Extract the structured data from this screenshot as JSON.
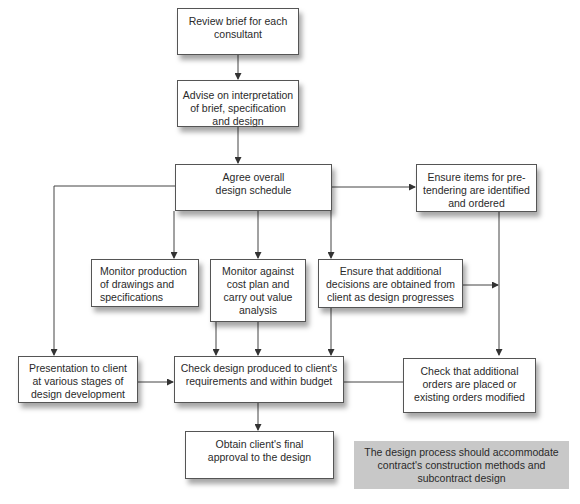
{
  "diagram": {
    "nodes": [
      {
        "id": "review_brief",
        "label": "Review brief for each consultant"
      },
      {
        "id": "advise",
        "label": "Advise on interpretation of brief, specification and design"
      },
      {
        "id": "agree_schedule",
        "label": "Agree overall design schedule"
      },
      {
        "id": "pretendering",
        "label": "Ensure items for pre-tendering are identified and ordered"
      },
      {
        "id": "monitor_drawings",
        "label": "Monitor production of drawings and specifications"
      },
      {
        "id": "monitor_cost",
        "label": "Monitor against cost plan and carry out value analysis"
      },
      {
        "id": "additional_decisions",
        "label": "Ensure that additional decisions are obtained from client as design progresses"
      },
      {
        "id": "presentation",
        "label": "Presentation to client at various stages of design development"
      },
      {
        "id": "check_design",
        "label": "Check design produced to client's requirements and within budget"
      },
      {
        "id": "check_orders",
        "label": "Check that additional orders are placed or existing orders modified"
      },
      {
        "id": "final_approval",
        "label": "Obtain client's final approval to the design"
      }
    ],
    "note": "The design process should accommodate contract's construction methods and subcontract design",
    "edges": [
      [
        "review_brief",
        "advise"
      ],
      [
        "advise",
        "agree_schedule"
      ],
      [
        "agree_schedule",
        "pretendering"
      ],
      [
        "agree_schedule",
        "monitor_drawings"
      ],
      [
        "agree_schedule",
        "monitor_cost"
      ],
      [
        "agree_schedule",
        "additional_decisions"
      ],
      [
        "agree_schedule",
        "presentation"
      ],
      [
        "monitor_drawings",
        "check_design"
      ],
      [
        "monitor_cost",
        "check_design"
      ],
      [
        "additional_decisions",
        "check_design"
      ],
      [
        "additional_decisions",
        "check_orders"
      ],
      [
        "pretendering",
        "check_orders"
      ],
      [
        "presentation",
        "check_design"
      ],
      [
        "check_orders",
        "check_design"
      ],
      [
        "check_design",
        "final_approval"
      ]
    ],
    "colors": {
      "border": "#555555",
      "line": "#444444",
      "note_bg": "#c8c8c8"
    }
  }
}
